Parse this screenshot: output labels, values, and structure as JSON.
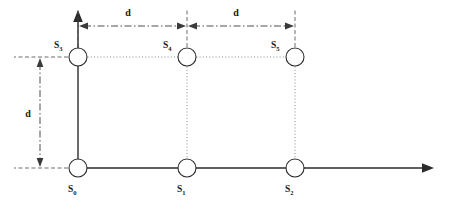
{
  "diagram": {
    "background_color": "#ffffff",
    "line_color": "#2b2b2b",
    "dotted_color": "#8a8a8a",
    "dimension_color": "#3a3a3a"
  },
  "axes": {
    "x_axis": {
      "name": "horizontal-axis",
      "has_arrow": true
    },
    "y_axis": {
      "name": "vertical-axis",
      "has_arrow": true
    }
  },
  "nodes": [
    {
      "id": "S0",
      "label": "S",
      "subscript": "0",
      "x": 78,
      "y": 168,
      "label_x": 68,
      "label_y": 190,
      "row": "bottom"
    },
    {
      "id": "S1",
      "label": "S",
      "subscript": "1",
      "x": 187,
      "y": 168,
      "label_x": 177,
      "label_y": 190,
      "row": "bottom"
    },
    {
      "id": "S2",
      "label": "S",
      "subscript": "2",
      "x": 295,
      "y": 168,
      "label_x": 285,
      "label_y": 190,
      "row": "bottom"
    },
    {
      "id": "S3",
      "label": "S",
      "subscript": "3",
      "x": 78,
      "y": 57,
      "label_x": 56,
      "label_y": 47,
      "row": "top"
    },
    {
      "id": "S4",
      "label": "S",
      "subscript": "4",
      "x": 187,
      "y": 57,
      "label_x": 165,
      "label_y": 47,
      "row": "top"
    },
    {
      "id": "S5",
      "label": "S",
      "subscript": "5",
      "x": 295,
      "y": 57,
      "label_x": 273,
      "label_y": 47,
      "row": "top"
    }
  ],
  "dimensions": [
    {
      "id": "d-top-left",
      "label": "d",
      "orientation": "horizontal",
      "from": 78,
      "to": 187,
      "at": 26,
      "label_x": 128,
      "label_y": 16
    },
    {
      "id": "d-top-right",
      "label": "d",
      "orientation": "horizontal",
      "from": 187,
      "to": 295,
      "at": 26,
      "label_x": 236,
      "label_y": 16
    },
    {
      "id": "d-left",
      "label": "d",
      "orientation": "vertical",
      "from": 57,
      "to": 168,
      "at": 40,
      "label_x": 28,
      "label_y": 117
    }
  ]
}
